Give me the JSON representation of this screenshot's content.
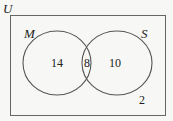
{
  "diagram": {
    "type": "venn",
    "universe_label": "U",
    "sets": [
      {
        "name": "M",
        "label": "M"
      },
      {
        "name": "S",
        "label": "S"
      }
    ],
    "regions": {
      "M_only": "14",
      "M_and_S": "8",
      "S_only": "10",
      "neither": "2"
    },
    "stroke_color": "#555555",
    "background_color": "#f7f7f5"
  }
}
